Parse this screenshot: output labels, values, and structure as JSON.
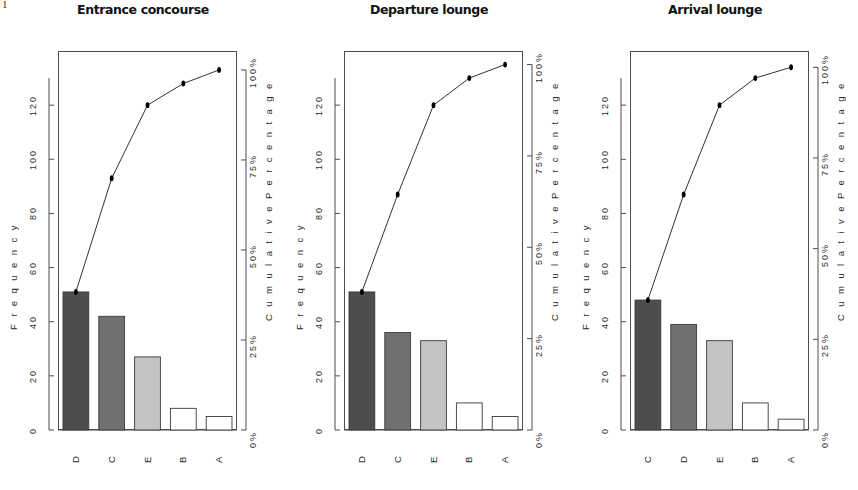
{
  "figure": {
    "width": 858,
    "height": 490,
    "background": "#ffffff",
    "stray_mark": "1"
  },
  "axes": {
    "y_left_title": "F r e q u e n c y",
    "y_left_ticks": [
      "0",
      "20",
      "40",
      "60",
      "80",
      "100",
      "120"
    ],
    "y_left_min": 0,
    "y_left_max": 140,
    "y_right_title": "C u m u l a t i v e   P e r c e n t a g e",
    "y_right_ticks": [
      "0%",
      "25%",
      "50%",
      "75%",
      "100%"
    ],
    "y_right_min": 0,
    "y_right_max": 100,
    "tick_color": "#4d4d4d",
    "box_color": "#4d4d4d"
  },
  "palette": {
    "bar_dark": "#4d4d4d",
    "bar_mid": "#707070",
    "bar_light": "#c4c4c4",
    "bar_white": "#ffffff",
    "bar_border": "#3a3a3a",
    "line_color": "#1a1a1a",
    "point_color": "#000000"
  },
  "chart_data": [
    {
      "type": "bar",
      "title": "Entrance concourse",
      "xlabel": "",
      "ylabel": "Frequency",
      "y2label": "Cumulative Percentage",
      "ylim": [
        0,
        140
      ],
      "y2lim": [
        0,
        100
      ],
      "grid": false,
      "legend": "none",
      "categories": [
        "D",
        "C",
        "E",
        "B",
        "A"
      ],
      "values": [
        51,
        42,
        27,
        8,
        5
      ],
      "bar_fills": [
        "#4d4d4d",
        "#707070",
        "#c4c4c4",
        "#ffffff",
        "#ffffff"
      ],
      "cumulative": [
        51,
        93,
        120,
        128,
        133
      ],
      "cumulative_percent": [
        38.3,
        69.9,
        90.2,
        96.2,
        100.0
      ],
      "total": 133
    },
    {
      "type": "bar",
      "title": "Departure lounge",
      "xlabel": "",
      "ylabel": "Frequency",
      "y2label": "Cumulative Percentage",
      "ylim": [
        0,
        140
      ],
      "y2lim": [
        0,
        100
      ],
      "grid": false,
      "legend": "none",
      "categories": [
        "D",
        "C",
        "E",
        "B",
        "A"
      ],
      "values": [
        51,
        36,
        33,
        10,
        5
      ],
      "bar_fills": [
        "#4d4d4d",
        "#707070",
        "#c4c4c4",
        "#ffffff",
        "#ffffff"
      ],
      "cumulative": [
        51,
        87,
        120,
        130,
        135
      ],
      "cumulative_percent": [
        37.8,
        64.4,
        88.9,
        96.3,
        100.0
      ],
      "total": 135
    },
    {
      "type": "bar",
      "title": "Arrival lounge",
      "xlabel": "",
      "ylabel": "Frequency",
      "y2label": "Cumulative Percentage",
      "ylim": [
        0,
        140
      ],
      "y2lim": [
        0,
        100
      ],
      "grid": false,
      "legend": "none",
      "categories": [
        "C",
        "D",
        "E",
        "B",
        "A"
      ],
      "values": [
        48,
        39,
        33,
        10,
        4
      ],
      "bar_fills": [
        "#4d4d4d",
        "#707070",
        "#c4c4c4",
        "#ffffff",
        "#ffffff"
      ],
      "cumulative": [
        48,
        87,
        120,
        130,
        134
      ],
      "cumulative_percent": [
        35.8,
        64.9,
        89.6,
        97.0,
        100.0
      ],
      "total": 134
    }
  ]
}
